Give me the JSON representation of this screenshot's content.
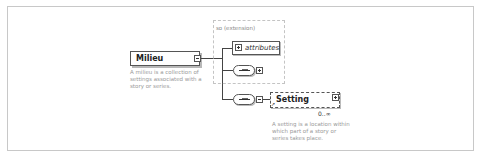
{
  "diagram": {
    "root_element": {
      "name": "Milieu",
      "description": "A milieu is a collection of settings associated with a story or series.",
      "toggle": "collapse"
    },
    "extension": {
      "label": "so (extension)",
      "attributes_label": "attributes",
      "sequence_toggle": "expand"
    },
    "child_sequence": {
      "toggle": "collapse"
    },
    "child_element": {
      "name": "Setting",
      "cardinality": "0..∞",
      "description": "A setting is a location within which part of a story or series takes place.",
      "toggle": "expand",
      "is_reference": true
    }
  }
}
